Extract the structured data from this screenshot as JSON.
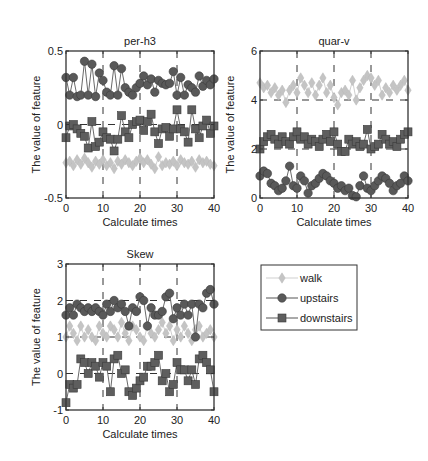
{
  "colors": {
    "walk": "#c4c4c4",
    "upstairs": "#595959",
    "downstairs": "#5e5e5e",
    "axis": "#333333",
    "grid": "#333333"
  },
  "legend": {
    "entries": [
      {
        "name": "walk",
        "marker": "diamond"
      },
      {
        "name": "upstairs",
        "marker": "circle"
      },
      {
        "name": "downstairs",
        "marker": "square"
      }
    ]
  },
  "chart_data": [
    {
      "type": "line",
      "title": "per-h3",
      "xlabel": "Calculate times",
      "ylabel": "The value of feature",
      "xlim": [
        0,
        40
      ],
      "ylim": [
        -0.5,
        0.5
      ],
      "xticks": [
        0,
        10,
        20,
        30,
        40
      ],
      "yticks": [
        -0.5,
        0,
        0.5
      ],
      "ytick_labels": [
        "-0.5",
        "0",
        "0.5"
      ],
      "grid": "dashed",
      "x": [
        0,
        1,
        2,
        3,
        4,
        5,
        6,
        7,
        8,
        9,
        10,
        11,
        12,
        13,
        14,
        15,
        16,
        17,
        18,
        19,
        20,
        21,
        22,
        23,
        24,
        25,
        26,
        27,
        28,
        29,
        30,
        31,
        32,
        33,
        34,
        35,
        36,
        37,
        38,
        39,
        40
      ],
      "series": [
        {
          "name": "walk",
          "marker": "diamond",
          "values": [
            -0.26,
            -0.25,
            -0.28,
            -0.24,
            -0.27,
            -0.23,
            -0.26,
            -0.29,
            -0.25,
            -0.27,
            -0.24,
            -0.28,
            -0.26,
            -0.3,
            -0.25,
            -0.27,
            -0.24,
            -0.26,
            -0.28,
            -0.25,
            -0.23,
            -0.26,
            -0.24,
            -0.27,
            -0.3,
            -0.22,
            -0.28,
            -0.26,
            -0.27,
            -0.25,
            -0.28,
            -0.24,
            -0.26,
            -0.27,
            -0.25,
            -0.29,
            -0.24,
            -0.26,
            -0.25,
            -0.27,
            -0.28
          ]
        },
        {
          "name": "upstairs",
          "marker": "circle",
          "values": [
            0.32,
            0.2,
            0.32,
            0.19,
            0.2,
            0.43,
            0.2,
            0.41,
            0.19,
            0.35,
            0.3,
            0.22,
            0.2,
            0.4,
            0.2,
            0.38,
            0.25,
            0.22,
            0.2,
            0.25,
            0.28,
            0.33,
            0.27,
            0.31,
            0.22,
            0.3,
            0.28,
            0.27,
            0.28,
            0.36,
            0.2,
            0.32,
            0.2,
            0.27,
            0.25,
            0.22,
            0.33,
            0.26,
            0.3,
            0.27,
            0.31
          ]
        },
        {
          "name": "downstairs",
          "marker": "square",
          "values": [
            -0.09,
            -0.01,
            0.0,
            -0.03,
            -0.06,
            -0.08,
            -0.16,
            0.02,
            -0.15,
            -0.12,
            -0.05,
            -0.09,
            -0.1,
            -0.18,
            -0.1,
            0.06,
            -0.05,
            -0.09,
            0.0,
            0.02,
            0.03,
            -0.04,
            0.02,
            0.07,
            -0.05,
            -0.13,
            -0.03,
            -0.02,
            -0.08,
            -0.03,
            0.1,
            -0.03,
            -0.05,
            -0.12,
            0.1,
            -0.03,
            -0.09,
            -0.01,
            0.03,
            -0.06,
            -0.01
          ]
        }
      ]
    },
    {
      "type": "line",
      "title": "quar-v",
      "xlabel": "Calculate times",
      "ylabel": "The value of feature",
      "xlim": [
        0,
        40
      ],
      "ylim": [
        0,
        6
      ],
      "xticks": [
        0,
        10,
        20,
        30,
        40
      ],
      "yticks": [
        0,
        2,
        4,
        6
      ],
      "ytick_labels": [
        "0",
        "2",
        "4",
        "6"
      ],
      "grid": "dashed",
      "x": [
        0,
        1,
        2,
        3,
        4,
        5,
        6,
        7,
        8,
        9,
        10,
        11,
        12,
        13,
        14,
        15,
        16,
        17,
        18,
        19,
        20,
        21,
        22,
        23,
        24,
        25,
        26,
        27,
        28,
        29,
        30,
        31,
        32,
        33,
        34,
        35,
        36,
        37,
        38,
        39,
        40
      ],
      "series": [
        {
          "name": "walk",
          "marker": "diamond",
          "values": [
            4.7,
            4.5,
            4.6,
            4.3,
            4.5,
            4.2,
            4.4,
            3.9,
            4.4,
            4.6,
            4.3,
            4.9,
            4.6,
            4.3,
            4.7,
            4.2,
            4.6,
            4.9,
            4.3,
            4.6,
            4.1,
            3.8,
            4.3,
            4.4,
            4.2,
            4.8,
            4.0,
            4.5,
            4.8,
            5.0,
            4.9,
            4.6,
            4.8,
            4.2,
            4.5,
            4.3,
            4.6,
            4.4,
            4.6,
            4.8,
            4.4
          ]
        },
        {
          "name": "upstairs",
          "marker": "circle",
          "values": [
            0.9,
            1.1,
            1.0,
            0.6,
            0.5,
            0.3,
            0.4,
            0.7,
            1.3,
            0.5,
            0.4,
            0.9,
            0.7,
            0.2,
            0.5,
            0.6,
            0.8,
            1.0,
            0.9,
            0.7,
            0.6,
            0.4,
            0.5,
            0.3,
            0.4,
            0.1,
            0.05,
            0.5,
            0.9,
            0.4,
            0.3,
            0.5,
            0.7,
            0.9,
            0.8,
            0.6,
            0.3,
            0.5,
            0.6,
            0.9,
            0.7
          ]
        },
        {
          "name": "downstairs",
          "marker": "square",
          "values": [
            2.0,
            2.3,
            2.5,
            2.6,
            2.4,
            2.2,
            2.5,
            2.3,
            2.2,
            2.5,
            2.7,
            2.4,
            2.5,
            2.2,
            2.4,
            2.3,
            2.1,
            2.4,
            2.6,
            2.3,
            2.7,
            2.2,
            1.9,
            1.9,
            2.4,
            2.2,
            2.3,
            2.1,
            2.2,
            2.8,
            2.0,
            2.1,
            2.2,
            2.6,
            2.4,
            2.2,
            2.3,
            2.1,
            2.4,
            2.6,
            2.7
          ]
        }
      ]
    },
    {
      "type": "line",
      "title": "Skew",
      "xlabel": "Calculate times",
      "ylabel": "The value of feature",
      "xlim": [
        0,
        40
      ],
      "ylim": [
        -1,
        3
      ],
      "xticks": [
        0,
        10,
        20,
        30,
        40
      ],
      "yticks": [
        -1,
        0,
        1,
        2,
        3
      ],
      "ytick_labels": [
        "-1",
        "0",
        "1",
        "2",
        "3"
      ],
      "grid": "dashed",
      "x": [
        0,
        1,
        2,
        3,
        4,
        5,
        6,
        7,
        8,
        9,
        10,
        11,
        12,
        13,
        14,
        15,
        16,
        17,
        18,
        19,
        20,
        21,
        22,
        23,
        24,
        25,
        26,
        27,
        28,
        29,
        30,
        31,
        32,
        33,
        34,
        35,
        36,
        37,
        38,
        39,
        40
      ],
      "series": [
        {
          "name": "walk",
          "marker": "diamond",
          "values": [
            1.0,
            1.3,
            1.1,
            0.9,
            1.3,
            1.0,
            1.2,
            1.0,
            0.9,
            1.3,
            1.1,
            1.0,
            1.3,
            1.2,
            1.0,
            1.4,
            1.1,
            0.9,
            1.3,
            1.2,
            1.0,
            0.9,
            1.3,
            1.1,
            1.0,
            1.2,
            1.4,
            1.1,
            1.3,
            0.9,
            1.2,
            1.0,
            1.3,
            1.1,
            0.9,
            1.2,
            1.3,
            1.0,
            1.1,
            1.2,
            1.0
          ]
        },
        {
          "name": "upstairs",
          "marker": "circle",
          "values": [
            1.6,
            1.8,
            1.6,
            1.9,
            1.8,
            1.7,
            1.8,
            1.7,
            1.8,
            1.7,
            1.6,
            1.9,
            1.7,
            2.0,
            1.8,
            1.9,
            1.7,
            1.3,
            1.8,
            1.7,
            2.1,
            2.0,
            1.3,
            1.8,
            1.6,
            1.6,
            1.7,
            2.1,
            2.2,
            1.5,
            1.8,
            1.6,
            1.9,
            1.6,
            1.9,
            1.0,
            1.9,
            1.8,
            2.2,
            2.3,
            1.9
          ]
        },
        {
          "name": "downstairs",
          "marker": "square",
          "values": [
            -0.8,
            -0.3,
            -0.4,
            -0.3,
            0.4,
            0.3,
            0.0,
            0.3,
            0.2,
            -0.1,
            0.3,
            0.2,
            -0.5,
            0.4,
            0.5,
            0.0,
            0.1,
            -0.5,
            -0.6,
            -0.4,
            -0.2,
            -0.1,
            0.2,
            0.2,
            0.3,
            0.5,
            -0.2,
            0.0,
            -0.5,
            -0.3,
            0.3,
            0.1,
            0.1,
            -0.2,
            0.1,
            -0.3,
            0.4,
            0.5,
            0.3,
            0.1,
            -0.5
          ]
        }
      ]
    }
  ],
  "layout": {
    "panels": [
      {
        "left": 66,
        "top": 51,
        "right": 214,
        "bottom": 198
      },
      {
        "left": 260,
        "top": 51,
        "right": 408,
        "bottom": 198
      },
      {
        "left": 66,
        "top": 264,
        "right": 214,
        "bottom": 410
      }
    ],
    "legend_box": {
      "left": 261,
      "top": 265,
      "right": 357,
      "bottom": 330
    }
  }
}
